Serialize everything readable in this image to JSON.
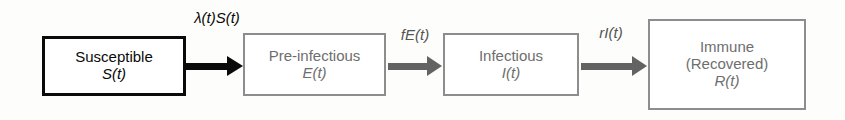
{
  "diagram": {
    "type": "compartmental-flow-diagram",
    "model": "SEIR",
    "background_color": "#fdfdfb",
    "compartments": [
      {
        "id": "susceptible",
        "title": "Susceptible",
        "variable": "S(t)",
        "style": "primary",
        "border_color": "#0a0a0a",
        "text_color": "#0a0a0a"
      },
      {
        "id": "pre-infectious",
        "title": "Pre-infectious",
        "variable": "E(t)",
        "style": "secondary",
        "border_color": "#8d8d8d",
        "text_color": "#6e6e6e"
      },
      {
        "id": "infectious",
        "title": "Infectious",
        "variable": "I(t)",
        "style": "secondary",
        "border_color": "#8d8d8d",
        "text_color": "#6e6e6e"
      },
      {
        "id": "immune-recovered",
        "title": "Immune",
        "subtitle": "(Recovered)",
        "variable": "R(t)",
        "style": "secondary",
        "border_color": "#8d8d8d",
        "text_color": "#6e6e6e"
      }
    ],
    "flows": [
      {
        "id": "infection",
        "label": "λ(t)S(t)",
        "from": "susceptible",
        "to": "pre-infectious",
        "color": "#0a0a0a",
        "style": "black"
      },
      {
        "id": "onset-of-infectiousness",
        "label": "fE(t)",
        "from": "pre-infectious",
        "to": "infectious",
        "color": "#636363",
        "style": "gray"
      },
      {
        "id": "recovery",
        "label": "rI(t)",
        "from": "infectious",
        "to": "immune-recovered",
        "color": "#636363",
        "style": "gray"
      }
    ]
  }
}
